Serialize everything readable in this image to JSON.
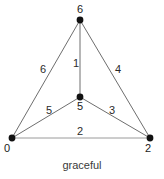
{
  "figure": {
    "caption": "graceful",
    "background_color": "#ffffff",
    "width": 164,
    "height": 179
  },
  "graph": {
    "vertex_color": "#111111",
    "edge_color": "#6e6e6e",
    "base_edge_color": "#9a9a9a",
    "vertices": [
      {
        "id": "top",
        "label": "6",
        "x": 80,
        "y": 20,
        "label_x": 80,
        "label_y": 4
      },
      {
        "id": "center",
        "label": "5",
        "x": 80,
        "y": 97,
        "label_x": 80,
        "label_y": 101
      },
      {
        "id": "bottom-left",
        "label": "0",
        "x": 12,
        "y": 138,
        "label_x": 7,
        "label_y": 143
      },
      {
        "id": "bottom-right",
        "label": "2",
        "x": 150,
        "y": 138,
        "label_x": 148,
        "label_y": 143
      }
    ],
    "edges": [
      {
        "id": "left-outer",
        "from": "bottom-left",
        "to": "top",
        "label": "6",
        "label_x": 43,
        "label_y": 64
      },
      {
        "id": "vertical",
        "from": "center",
        "to": "top",
        "label": "1",
        "label_x": 76,
        "label_y": 58
      },
      {
        "id": "right-outer",
        "from": "bottom-right",
        "to": "top",
        "label": "4",
        "label_x": 118,
        "label_y": 64
      },
      {
        "id": "left-inner",
        "from": "bottom-left",
        "to": "center",
        "label": "5",
        "label_x": 49,
        "label_y": 105
      },
      {
        "id": "right-inner",
        "from": "center",
        "to": "bottom-right",
        "label": "3",
        "label_x": 112,
        "label_y": 105
      },
      {
        "id": "base",
        "from": "bottom-left",
        "to": "bottom-right",
        "label": "2",
        "label_x": 80,
        "label_y": 126
      }
    ]
  }
}
